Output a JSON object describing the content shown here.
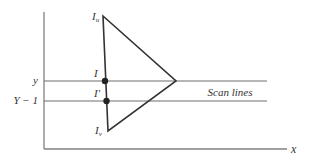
{
  "diagram": {
    "colors": {
      "axis": "#808080",
      "line": "#333333",
      "scan": "#6e6e6e",
      "text": "#333333"
    },
    "axes": {
      "x_label": "x"
    },
    "scan_lines": {
      "label": "Scan lines",
      "upper": {
        "label": "y"
      },
      "lower": {
        "label": "Y − 1"
      }
    },
    "vertices": {
      "top": {
        "label": "I",
        "subscript": "u"
      },
      "bottom": {
        "label": "I",
        "subscript": "v"
      }
    },
    "points": {
      "upper": {
        "label": "I"
      },
      "lower": {
        "label": "I′"
      }
    }
  }
}
